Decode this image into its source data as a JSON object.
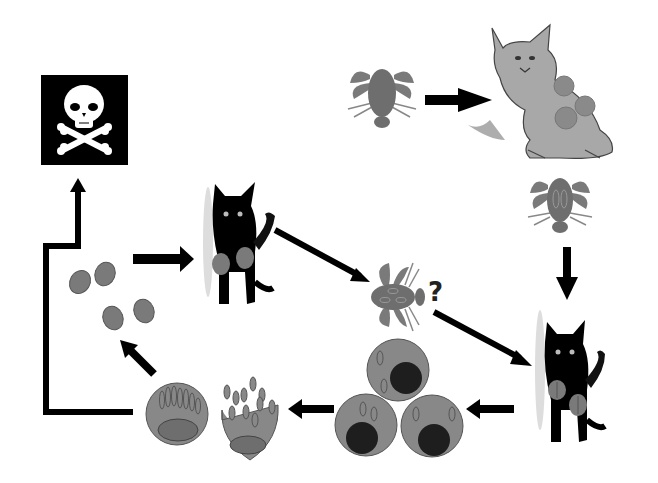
{
  "diagram": {
    "type": "parasite-life-cycle",
    "style": "grayscale",
    "colors": {
      "background": "#ffffff",
      "arrow": "#000000",
      "parasite_gray": "#808080",
      "cell_gray": "#888888",
      "nucleus_dark": "#222222",
      "skull_box": "#000000",
      "lynx_fill": "#a8a8a8"
    },
    "nodes": [
      {
        "id": "death",
        "label": "skull-and-crossbones"
      },
      {
        "id": "tick-top",
        "label": "tick (unfed)"
      },
      {
        "id": "lynx",
        "label": "bobcat / lynx reservoir host with parasites"
      },
      {
        "id": "tick-infected",
        "label": "tick with parasites"
      },
      {
        "id": "cat-right",
        "label": "domestic cat infected"
      },
      {
        "id": "tick-middle",
        "label": "tick with parasites (uncertain)"
      },
      {
        "id": "cat-left",
        "label": "domestic cat infected"
      },
      {
        "id": "merozoites",
        "label": "free parasites"
      },
      {
        "id": "schizont-cells",
        "label": "infected cells (3)"
      },
      {
        "id": "schizont-rupture",
        "label": "schizont cells rupturing"
      }
    ],
    "annotations": {
      "question_mark": "?"
    }
  }
}
